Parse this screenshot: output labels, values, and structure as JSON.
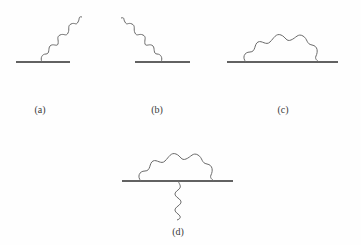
{
  "figure": {
    "diagrams": [
      {
        "id": "a",
        "label": "(a)",
        "description": "Fermion line with outgoing photon emitted up-right"
      },
      {
        "id": "b",
        "label": "(b)",
        "description": "Fermion line with incoming photon from up-left"
      },
      {
        "id": "c",
        "label": "(c)",
        "description": "Fermion line with photon self-energy loop"
      },
      {
        "id": "d",
        "label": "(d)",
        "description": "Fermion line with photon loop and external photon below (vertex correction)"
      }
    ]
  },
  "colors": {
    "line": "#2e2e2e",
    "wave": "#6a6a6a",
    "background": "#fefefe"
  }
}
